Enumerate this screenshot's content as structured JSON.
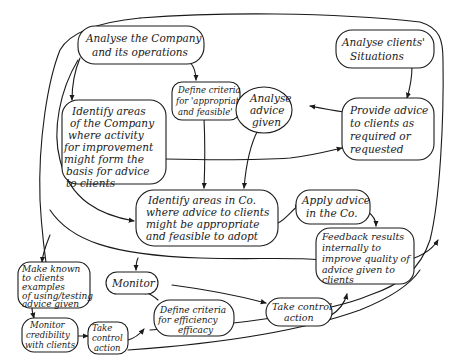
{
  "diagram": {
    "type": "hand-drawn activity / systems diagram",
    "nodes": [
      {
        "id": "analyse_company",
        "lines": [
          "Analyse the Company",
          "and its operations"
        ]
      },
      {
        "id": "define_criteria_appropriate",
        "lines": [
          "Define criteria",
          "for 'appropriate",
          "and feasible'"
        ]
      },
      {
        "id": "analyse_advice",
        "lines": [
          "Analyse",
          "advice",
          "given"
        ]
      },
      {
        "id": "analyse_clients",
        "lines": [
          "Analyse clients'",
          "Situations"
        ]
      },
      {
        "id": "identify_areas_company",
        "lines": [
          "Identify areas",
          "of the Company",
          "where activity",
          "for improvement",
          "might form the",
          "basis for advice",
          "to clients"
        ]
      },
      {
        "id": "provide_advice",
        "lines": [
          "Provide advice",
          "to clients as",
          "required or",
          "requested"
        ]
      },
      {
        "id": "identify_areas_co",
        "lines": [
          "Identify areas in Co.",
          "where advice to clients",
          "might be appropriate",
          "and feasible to adopt"
        ]
      },
      {
        "id": "apply_advice",
        "lines": [
          "Apply advice",
          "in the Co."
        ]
      },
      {
        "id": "feedback_results",
        "lines": [
          "Feedback results",
          "internally to",
          "improve quality of",
          "advice given to",
          "clients"
        ]
      },
      {
        "id": "make_known",
        "lines": [
          "Make known",
          "to clients",
          "examples",
          "of using/testing",
          "advice given"
        ]
      },
      {
        "id": "monitor",
        "lines": [
          "Monitor"
        ]
      },
      {
        "id": "define_criteria_efficiency",
        "lines": [
          "Define criteria",
          "for efficiency",
          "efficacy"
        ]
      },
      {
        "id": "take_control_right",
        "lines": [
          "Take control",
          "action"
        ]
      },
      {
        "id": "monitor_credibility",
        "lines": [
          "Monitor",
          "credibility",
          "with clients"
        ]
      },
      {
        "id": "take_control_left",
        "lines": [
          "Take",
          "control",
          "action"
        ]
      }
    ],
    "edges": [
      {
        "from": "analyse_company",
        "to": "identify_areas_company"
      },
      {
        "from": "analyse_company",
        "to": "define_criteria_appropriate"
      },
      {
        "from": "analyse_clients",
        "to": "provide_advice"
      },
      {
        "from": "provide_advice",
        "to": "analyse_advice"
      },
      {
        "from": "identify_areas_company",
        "to": "provide_advice"
      },
      {
        "from": "define_criteria_appropriate",
        "to": "identify_areas_co"
      },
      {
        "from": "analyse_advice",
        "to": "identify_areas_co"
      },
      {
        "from": "analyse_company",
        "to": "identify_areas_co"
      },
      {
        "from": "identify_areas_co",
        "to": "apply_advice"
      },
      {
        "from": "apply_advice",
        "to": "feedback_results"
      },
      {
        "from": "analyse_company",
        "to": "make_known"
      },
      {
        "from": "make_known",
        "to": "monitor_credibility"
      },
      {
        "from": "monitor_credibility",
        "to": "take_control_left"
      },
      {
        "from": "take_control_left",
        "to": "feedback_results"
      },
      {
        "from": "analyse_company",
        "to": "monitor"
      },
      {
        "from": "define_criteria_efficiency",
        "to": "monitor"
      },
      {
        "from": "monitor",
        "to": "take_control_right"
      },
      {
        "from": "take_control_right",
        "to": "feedback_results"
      }
    ],
    "colors": {
      "ink": "#1a1a1a",
      "paper": "#ffffff"
    }
  }
}
